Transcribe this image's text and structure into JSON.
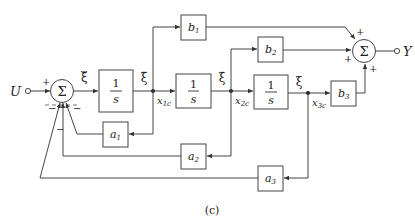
{
  "figure": {
    "caption": "(c)",
    "input_label": "U",
    "output_label": "Y"
  },
  "summers": [
    {
      "id": "sum1",
      "symbol": "Σ",
      "signs": {
        "input": "+",
        "fb1": "−",
        "fb2": "−",
        "fb3": "−"
      }
    },
    {
      "id": "sum2",
      "symbol": "Σ",
      "signs": {
        "b1": "+",
        "b2": "+",
        "b3": "+"
      }
    }
  ],
  "integrators": [
    {
      "id": "int1",
      "num": "1",
      "den": "s"
    },
    {
      "id": "int2",
      "num": "1",
      "den": "s"
    },
    {
      "id": "int3",
      "num": "1",
      "den": "s"
    }
  ],
  "gains": {
    "b1": {
      "base": "b",
      "sub": "1"
    },
    "b2": {
      "base": "b",
      "sub": "2"
    },
    "b3": {
      "base": "b",
      "sub": "3"
    },
    "a1": {
      "base": "a",
      "sub": "1"
    },
    "a2": {
      "base": "a",
      "sub": "2"
    },
    "a3": {
      "base": "a",
      "sub": "3"
    }
  },
  "signals": {
    "xi_ddd": "ξ⃛",
    "xi_dd": "ξ̈",
    "xi_d": "ξ̇",
    "xi": "ξ",
    "x1c": {
      "base": "x",
      "sub": "1c"
    },
    "x2c": {
      "base": "x",
      "sub": "2c"
    },
    "x3c": {
      "base": "x",
      "sub": "3c"
    }
  }
}
